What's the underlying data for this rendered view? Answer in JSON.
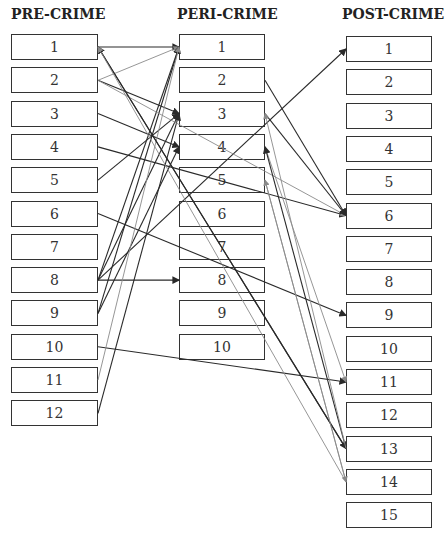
{
  "columns": {
    "pre": {
      "title": "PRE-CRIME",
      "items": [
        "1",
        "2",
        "3",
        "4",
        "5",
        "6",
        "7",
        "8",
        "9",
        "10",
        "11",
        "12"
      ]
    },
    "peri": {
      "title": "PERI-CRIME",
      "items": [
        "1",
        "2",
        "3",
        "4",
        "5",
        "6",
        "7",
        "8",
        "9",
        "10"
      ]
    },
    "post": {
      "title": "POST-CRIME",
      "items": [
        "1",
        "2",
        "3",
        "4",
        "5",
        "6",
        "7",
        "8",
        "9",
        "10",
        "11",
        "12",
        "13",
        "14",
        "15"
      ]
    }
  },
  "connections": [
    {
      "from": "pre-1",
      "to": "peri-1",
      "shade": "dark"
    },
    {
      "from": "pre-2",
      "to": "peri-1",
      "shade": "gray"
    },
    {
      "from": "pre-2",
      "to": "peri-3",
      "shade": "dark"
    },
    {
      "from": "pre-3",
      "to": "peri-4",
      "shade": "dark"
    },
    {
      "from": "pre-4",
      "to": "post-6",
      "shade": "dark"
    },
    {
      "from": "pre-5",
      "to": "peri-3",
      "shade": "dark"
    },
    {
      "from": "pre-6",
      "to": "post-9",
      "shade": "dark"
    },
    {
      "from": "pre-8",
      "to": "peri-8",
      "shade": "dark"
    },
    {
      "from": "pre-8",
      "to": "peri-1",
      "shade": "dark"
    },
    {
      "from": "pre-8",
      "to": "peri-3",
      "shade": "dark"
    },
    {
      "from": "pre-8",
      "to": "post-1",
      "shade": "dark"
    },
    {
      "from": "pre-9",
      "to": "peri-4",
      "shade": "dark"
    },
    {
      "from": "pre-9",
      "to": "peri-1",
      "shade": "dark"
    },
    {
      "from": "pre-10",
      "to": "post-11",
      "shade": "dark"
    },
    {
      "from": "pre-11",
      "to": "peri-1",
      "shade": "gray"
    },
    {
      "from": "pre-12",
      "to": "peri-3",
      "shade": "dark"
    },
    {
      "from": "pre-1",
      "to": "post-13",
      "shade": "dark"
    },
    {
      "from": "pre-2",
      "to": "post-6",
      "shade": "gray"
    },
    {
      "from": "peri-2",
      "to": "post-6",
      "shade": "dark"
    },
    {
      "from": "peri-3",
      "to": "post-6",
      "shade": "dark"
    },
    {
      "from": "peri-4",
      "to": "post-11",
      "shade": "gray"
    },
    {
      "from": "peri-5",
      "to": "post-14",
      "shade": "gray"
    },
    {
      "from": "post-13",
      "to": "pre-1",
      "shade": "dark"
    },
    {
      "from": "post-14",
      "to": "pre-1",
      "shade": "gray"
    },
    {
      "from": "post-13",
      "to": "peri-4",
      "shade": "dark"
    },
    {
      "from": "post-14",
      "to": "peri-5",
      "shade": "gray"
    },
    {
      "from": "post-13",
      "to": "peri-3",
      "shade": "gray"
    }
  ],
  "colors": {
    "dark": "#2a2a2a",
    "gray": "#8a8a8a",
    "border": "#333333"
  }
}
